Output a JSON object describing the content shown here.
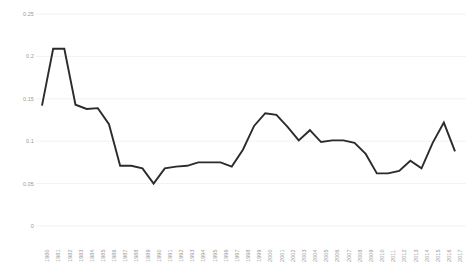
{
  "chart_data": {
    "type": "line",
    "title": "",
    "subtitle": "",
    "xlabel": "",
    "ylabel": "",
    "xlim": [
      1980,
      2017
    ],
    "ylim": [
      0,
      0.25
    ],
    "grid": true,
    "legend": null,
    "legend_position": "none",
    "line_color": "#2b2b2b",
    "grid_color": "#f2f2f2",
    "tick_label_color": "#9a9a9a",
    "y_ticks": [
      "0",
      "0.05",
      "0.1",
      "0.15",
      "0.2",
      "0.25"
    ],
    "y_tick_values": [
      0,
      0.05,
      0.1,
      0.15,
      0.2,
      0.25
    ],
    "categories": [
      "1980",
      "1981",
      "1982",
      "1983",
      "1984",
      "1985",
      "1986",
      "1987",
      "1988",
      "1989",
      "1990",
      "1991",
      "1992",
      "1993",
      "1994",
      "1995",
      "1996",
      "1997",
      "1998",
      "1999",
      "2000",
      "2001",
      "2002",
      "2003",
      "2004",
      "2005",
      "2006",
      "2007",
      "2008",
      "2009",
      "2010",
      "2011",
      "2012",
      "2013",
      "2014",
      "2015",
      "2016",
      "2017"
    ],
    "values": [
      0.142,
      0.209,
      0.209,
      0.143,
      0.138,
      0.139,
      0.12,
      0.071,
      0.071,
      0.068,
      0.05,
      0.068,
      0.07,
      0.071,
      0.075,
      0.075,
      0.075,
      0.07,
      0.09,
      0.118,
      0.133,
      0.131,
      0.117,
      0.101,
      0.113,
      0.099,
      0.101,
      0.101,
      0.098,
      0.085,
      0.062,
      0.062,
      0.065,
      0.077,
      0.068,
      0.098,
      0.122,
      0.088
    ]
  }
}
